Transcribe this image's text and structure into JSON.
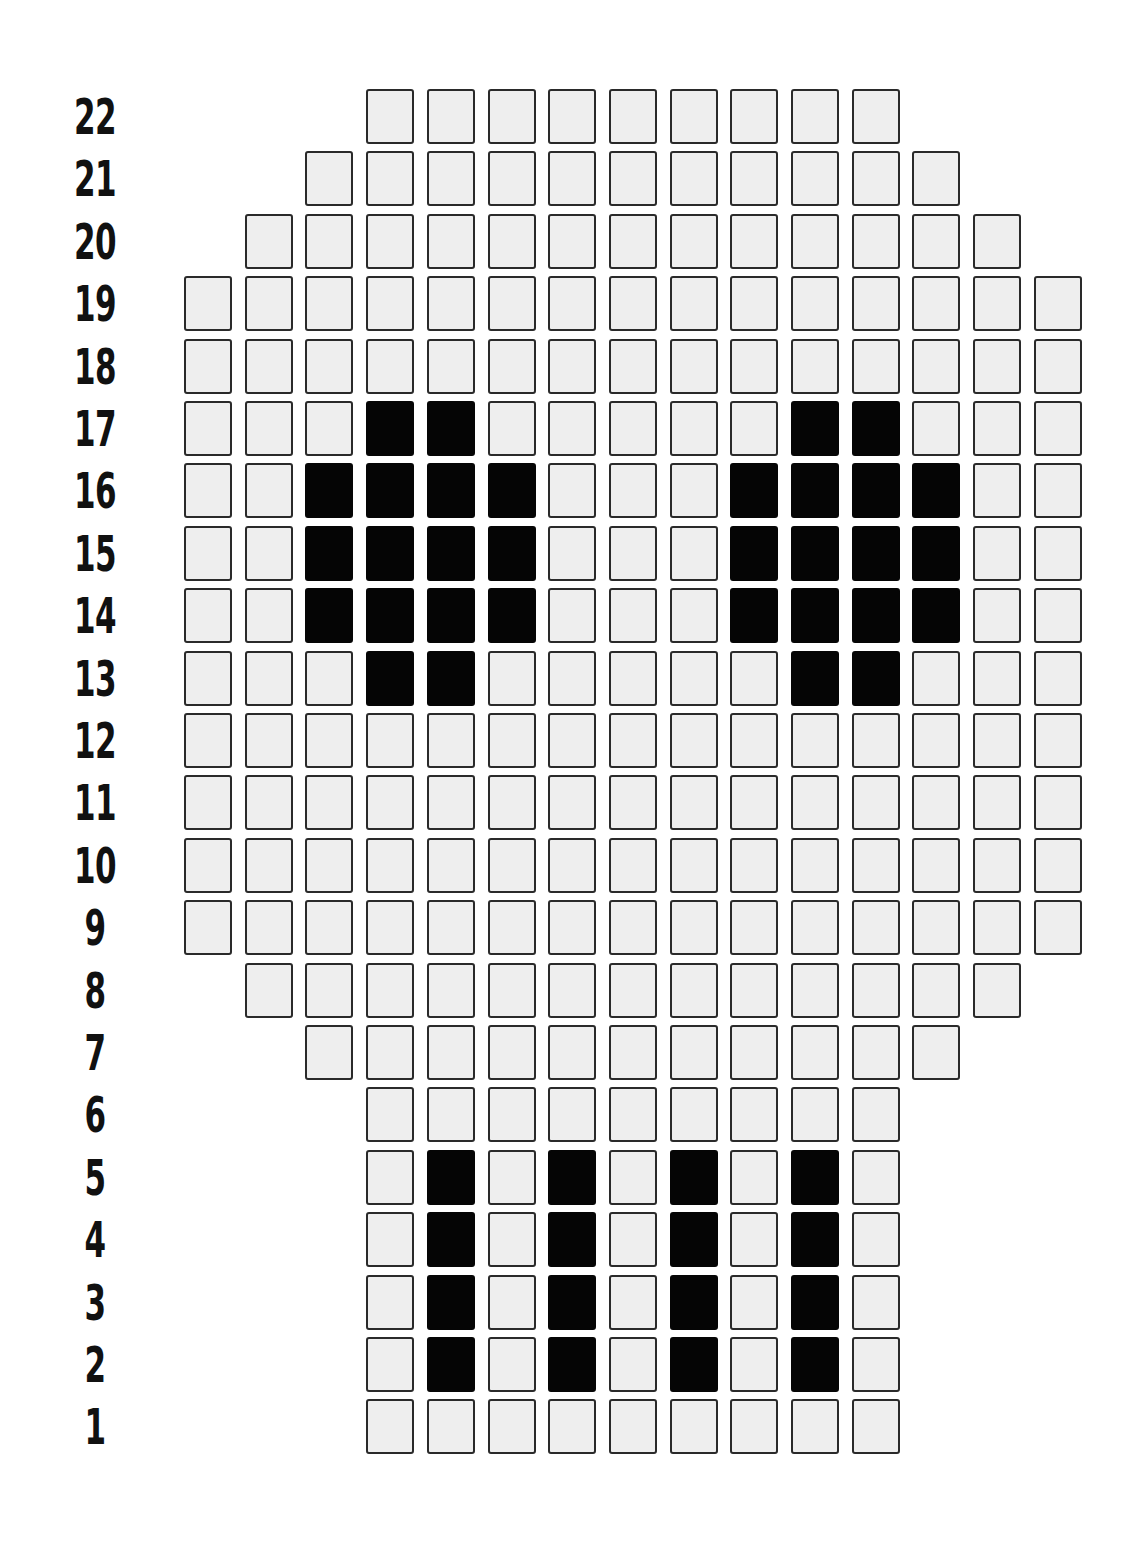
{
  "grid": {
    "columns": 15,
    "rows": 22,
    "colors": {
      "empty": "#eeeeee",
      "filled": "#050505",
      "border": "#2a2a2a"
    },
    "row_labels": [
      "22",
      "21",
      "20",
      "19",
      "18",
      "17",
      "16",
      "15",
      "14",
      "13",
      "12",
      "11",
      "10",
      "9",
      "8",
      "7",
      "6",
      "5",
      "4",
      "3",
      "2",
      "1"
    ],
    "rows_data": [
      {
        "label": "22",
        "start": 3,
        "end": 11,
        "filled": []
      },
      {
        "label": "21",
        "start": 2,
        "end": 12,
        "filled": []
      },
      {
        "label": "20",
        "start": 1,
        "end": 13,
        "filled": []
      },
      {
        "label": "19",
        "start": 0,
        "end": 14,
        "filled": []
      },
      {
        "label": "18",
        "start": 0,
        "end": 14,
        "filled": []
      },
      {
        "label": "17",
        "start": 0,
        "end": 14,
        "filled": [
          3,
          4,
          10,
          11
        ]
      },
      {
        "label": "16",
        "start": 0,
        "end": 14,
        "filled": [
          2,
          3,
          4,
          5,
          9,
          10,
          11,
          12
        ]
      },
      {
        "label": "15",
        "start": 0,
        "end": 14,
        "filled": [
          2,
          3,
          4,
          5,
          9,
          10,
          11,
          12
        ]
      },
      {
        "label": "14",
        "start": 0,
        "end": 14,
        "filled": [
          2,
          3,
          4,
          5,
          9,
          10,
          11,
          12
        ]
      },
      {
        "label": "13",
        "start": 0,
        "end": 14,
        "filled": [
          3,
          4,
          10,
          11
        ]
      },
      {
        "label": "12",
        "start": 0,
        "end": 14,
        "filled": []
      },
      {
        "label": "11",
        "start": 0,
        "end": 14,
        "filled": []
      },
      {
        "label": "10",
        "start": 0,
        "end": 14,
        "filled": []
      },
      {
        "label": "9",
        "start": 0,
        "end": 14,
        "filled": []
      },
      {
        "label": "8",
        "start": 1,
        "end": 13,
        "filled": []
      },
      {
        "label": "7",
        "start": 2,
        "end": 12,
        "filled": []
      },
      {
        "label": "6",
        "start": 3,
        "end": 11,
        "filled": []
      },
      {
        "label": "5",
        "start": 3,
        "end": 11,
        "filled": [
          4,
          6,
          8,
          10
        ]
      },
      {
        "label": "4",
        "start": 3,
        "end": 11,
        "filled": [
          4,
          6,
          8,
          10
        ]
      },
      {
        "label": "3",
        "start": 3,
        "end": 11,
        "filled": [
          4,
          6,
          8,
          10
        ]
      },
      {
        "label": "2",
        "start": 3,
        "end": 11,
        "filled": [
          4,
          6,
          8,
          10
        ]
      },
      {
        "label": "1",
        "start": 3,
        "end": 11,
        "filled": []
      }
    ]
  }
}
